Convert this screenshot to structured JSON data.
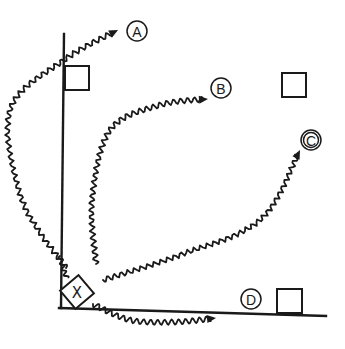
{
  "diagram": {
    "colors": {
      "ink": "#1a1a1a",
      "background": "#ffffff"
    },
    "walls": {
      "vertical": {
        "x1": 64,
        "y1": 34,
        "x2": 61,
        "y2": 308
      },
      "horizontal": {
        "x1": 59,
        "y1": 308,
        "x2": 326,
        "y2": 316
      }
    },
    "source": {
      "label": "X",
      "cx": 77,
      "cy": 292,
      "size": 24,
      "rotation": -40
    },
    "boxes": [
      {
        "id": "box-a",
        "x": 65,
        "y": 66,
        "w": 24,
        "h": 24
      },
      {
        "id": "box-b",
        "x": 282,
        "y": 73,
        "w": 24,
        "h": 24
      },
      {
        "id": "box-d",
        "x": 277,
        "y": 289,
        "w": 25,
        "h": 24
      }
    ],
    "labels": [
      {
        "id": "A",
        "text": "A",
        "cx": 137,
        "cy": 31,
        "r": 10
      },
      {
        "id": "B",
        "text": "B",
        "cx": 221,
        "cy": 88,
        "r": 10
      },
      {
        "id": "C",
        "text": "C",
        "cx": 311,
        "cy": 140,
        "r": 10,
        "double": true
      },
      {
        "id": "D",
        "text": "D",
        "cx": 251,
        "cy": 299,
        "r": 10
      }
    ],
    "waves": [
      {
        "id": "wave-a",
        "target": "A",
        "points": [
          [
            66,
            268
          ],
          [
            22,
            200
          ],
          [
            10,
            110
          ],
          [
            64,
            60
          ],
          [
            118,
            30
          ]
        ],
        "amp": 2.6,
        "wavelength": 7.5,
        "arrow": true
      },
      {
        "id": "wave-b",
        "target": "B",
        "points": [
          [
            96,
            264
          ],
          [
            92,
            200
          ],
          [
            110,
            130
          ],
          [
            160,
            105
          ],
          [
            208,
            99
          ]
        ],
        "amp": 2.6,
        "wavelength": 7,
        "arrow": true
      },
      {
        "id": "wave-c",
        "target": "C",
        "points": [
          [
            103,
            280
          ],
          [
            180,
            255
          ],
          [
            260,
            220
          ],
          [
            300,
            150
          ]
        ],
        "amp": 2.6,
        "wavelength": 7,
        "arrow": true
      },
      {
        "id": "wave-d",
        "target": "D",
        "points": [
          [
            93,
            304
          ],
          [
            130,
            320
          ],
          [
            175,
            322
          ],
          [
            216,
            318
          ]
        ],
        "amp": 2.6,
        "wavelength": 7,
        "arrow": true
      },
      {
        "id": "wave-corner",
        "target": "",
        "points": [
          [
            60,
            256
          ],
          [
            63,
            268
          ],
          [
            67,
            278
          ]
        ],
        "amp": 2.0,
        "wavelength": 6,
        "arrow": false
      }
    ]
  }
}
